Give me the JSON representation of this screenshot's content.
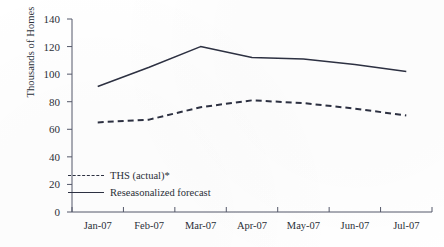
{
  "chart_data": {
    "type": "line",
    "title": "",
    "xlabel": "",
    "ylabel": "Thousands of Homes",
    "categories": [
      "Jan-07",
      "Feb-07",
      "Mar-07",
      "Apr-07",
      "May-07",
      "Jun-07",
      "Jul-07"
    ],
    "ylim": [
      0,
      140
    ],
    "yticks": [
      0,
      20,
      40,
      60,
      80,
      100,
      120,
      140
    ],
    "ytick_labels": [
      "0",
      "20",
      "40",
      "60",
      "80",
      "100",
      "120",
      "140"
    ],
    "grid": false,
    "legend_position": "lower-left-inside",
    "series": [
      {
        "name": "THS (actual)*",
        "style": "dashed",
        "color": "#2d3142",
        "values": [
          65,
          67,
          76,
          81,
          79,
          75,
          70
        ]
      },
      {
        "name": "Reseasonalized forecast",
        "style": "solid",
        "color": "#2d3142",
        "values": [
          91,
          105,
          120,
          112,
          111,
          107,
          102
        ]
      }
    ]
  },
  "axes": {
    "y_title": "Thousands of Homes",
    "y_tick_labels": [
      "140",
      "120",
      "100",
      "80",
      "60",
      "40",
      "20",
      "0"
    ],
    "x_tick_labels": [
      "Jan-07",
      "Feb-07",
      "Mar-07",
      "Apr-07",
      "May-07",
      "Jun-07",
      "Jul-07"
    ]
  },
  "legend": {
    "items": [
      {
        "label": "THS (actual)*",
        "style": "dashed"
      },
      {
        "label": "Reseasonalized forecast",
        "style": "solid"
      }
    ]
  },
  "colors": {
    "line": "#2d3142",
    "axis": "#55596a",
    "text": "#2b2f38",
    "background": "#ffffff"
  }
}
